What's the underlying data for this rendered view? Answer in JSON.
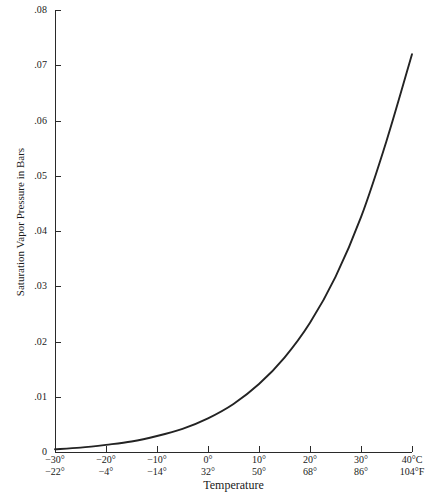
{
  "chart_data": {
    "type": "line",
    "title": "",
    "xlabel": "Temperature",
    "ylabel": "Saturation Vapor Pressure in Bars",
    "xlim": [
      -30,
      40
    ],
    "ylim": [
      0,
      0.08
    ],
    "grid": false,
    "legend": null,
    "x_unit_primary": "°C",
    "x_unit_secondary": "°F",
    "y_ticks": [
      ".08",
      ".07",
      ".06",
      ".05",
      ".04",
      ".03",
      ".02",
      ".01",
      "0"
    ],
    "y_tick_values": [
      0.08,
      0.07,
      0.06,
      0.05,
      0.04,
      0.03,
      0.02,
      0.01,
      0
    ],
    "x_ticks_celsius": [
      "−30°",
      "−20°",
      "−10°",
      "0°",
      "10°",
      "20°",
      "30°",
      "40°C"
    ],
    "x_ticks_fahrenheit": [
      "−22°",
      "−4°",
      "−14°",
      "32°",
      "50°",
      "68°",
      "86°",
      "104°F"
    ],
    "x_tick_values": [
      -30,
      -20,
      -10,
      0,
      10,
      20,
      30,
      40
    ],
    "series": [
      {
        "name": "Saturation vapor pressure",
        "color": "#232323",
        "x": [
          -30,
          -25,
          -20,
          -15,
          -10,
          -5,
          0,
          5,
          10,
          15,
          20,
          25,
          30,
          35,
          40
        ],
        "values": [
          0.0005,
          0.0008,
          0.0013,
          0.0019,
          0.0029,
          0.0042,
          0.0061,
          0.0087,
          0.0123,
          0.0171,
          0.0234,
          0.0317,
          0.0425,
          0.0563,
          0.072
        ]
      }
    ]
  },
  "axes": {
    "y_title": "Saturation Vapor Pressure in Bars",
    "x_title": "Temperature"
  }
}
